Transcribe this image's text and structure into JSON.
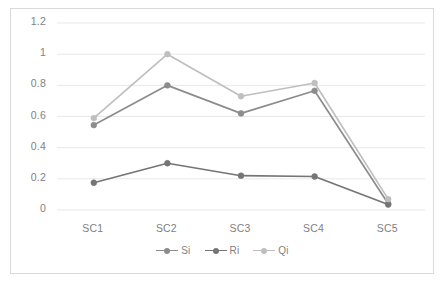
{
  "chart_data": {
    "type": "line",
    "title": "",
    "xlabel": "",
    "ylabel": "",
    "categories": [
      "SC1",
      "SC2",
      "SC3",
      "SC4",
      "SC5"
    ],
    "ylim": [
      0,
      1.2
    ],
    "yticks": [
      "0",
      "0.2",
      "0.4",
      "0.6",
      "0.8",
      "1",
      "1.2"
    ],
    "ytick_values": [
      0,
      0.2,
      0.4,
      0.6,
      0.8,
      1,
      1.2
    ],
    "grid": "horizontal",
    "legend_position": "bottom-center",
    "series": [
      {
        "name": "Si",
        "color": "#8c8c8c",
        "values": [
          0.545,
          0.8,
          0.62,
          0.765,
          0.04
        ]
      },
      {
        "name": "Ri",
        "color": "#757575",
        "values": [
          0.175,
          0.3,
          0.22,
          0.215,
          0.035
        ]
      },
      {
        "name": "Qi",
        "color": "#bfbfbf",
        "values": [
          0.59,
          1.0,
          0.73,
          0.815,
          0.07
        ]
      }
    ]
  },
  "colors": {
    "grid": "#e8e8e8",
    "border": "#d9d9d9",
    "tick_text": "#7f7f7f",
    "background": "#ffffff"
  }
}
